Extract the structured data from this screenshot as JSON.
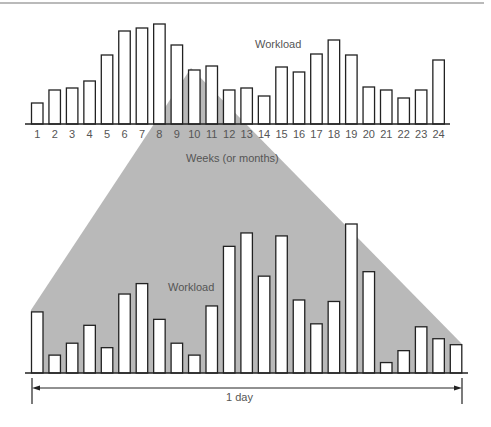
{
  "figure": {
    "top_rule": true,
    "shade_color": "#b9b9b9",
    "bar_stroke": "#222222",
    "bar_fill": "#ffffff",
    "text_color": "#555555"
  },
  "chart_data": [
    {
      "type": "bar",
      "title": "",
      "annotation": "Workload",
      "xlabel": "Weeks (or months)",
      "ylabel": "",
      "categories": [
        "1",
        "2",
        "3",
        "4",
        "5",
        "6",
        "7",
        "8",
        "9",
        "10",
        "11",
        "12",
        "13",
        "14",
        "15",
        "16",
        "17",
        "18",
        "19",
        "20",
        "21",
        "22",
        "23",
        "24"
      ],
      "values": [
        21,
        34,
        36,
        43,
        69,
        93,
        96,
        100,
        79,
        54,
        58,
        34,
        36,
        28,
        57,
        52,
        70,
        84,
        69,
        37,
        34,
        26,
        34,
        64
      ],
      "ylim": [
        0,
        100
      ],
      "grid": false,
      "legend": "none"
    },
    {
      "type": "bar",
      "title": "",
      "annotation": "Workload",
      "xlabel": "1 day",
      "ylabel": "",
      "categories": [
        "1",
        "2",
        "3",
        "4",
        "5",
        "6",
        "7",
        "8",
        "9",
        "10",
        "11",
        "12",
        "13",
        "14",
        "15",
        "16",
        "17",
        "18",
        "19",
        "20",
        "21",
        "22",
        "23",
        "24",
        "25"
      ],
      "values": [
        41,
        12,
        20,
        32,
        17,
        53,
        60,
        36,
        20,
        12,
        45,
        85,
        94,
        65,
        92,
        49,
        33,
        48,
        100,
        68,
        7,
        15,
        31,
        23,
        19
      ],
      "ylim": [
        0,
        100
      ],
      "grid": false,
      "legend": "none"
    }
  ],
  "labels": {
    "top_workload": "Workload",
    "x_axis": "Weeks (or months)",
    "bottom_workload": "Workload",
    "span": "1 day"
  }
}
